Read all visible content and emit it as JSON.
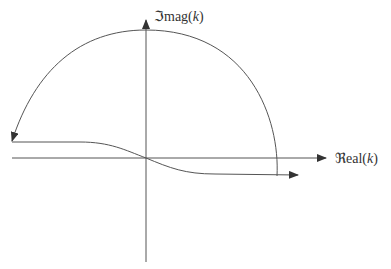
{
  "diagram": {
    "type": "complex-plane contour",
    "axes": {
      "horizontal_label": "ℜeal(k)",
      "vertical_label": "ℑmag(k)"
    },
    "labels": {
      "imag_prefix": "ℑmag(",
      "imag_var": "k",
      "real_prefix": "ℜeal(",
      "real_var": "k",
      "close_paren": ")"
    },
    "stroke_color": "#444444",
    "elements": [
      "real axis with arrow pointing right",
      "imaginary axis with arrow pointing up",
      "semicircular arc from lower right, over the top, down to the left, arrow at left end",
      "contour from far left running flat, then passing through origin and curving below real axis to the right with arrow"
    ]
  }
}
